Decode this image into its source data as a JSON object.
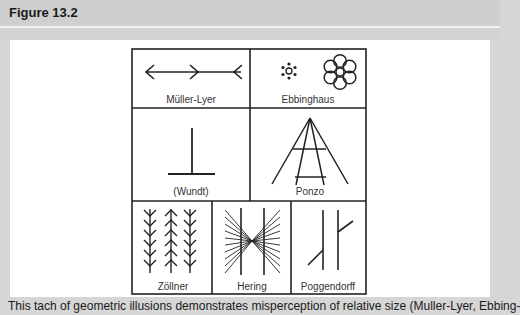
{
  "header": {
    "title": "Figure 13.2"
  },
  "figure": {
    "illusions": [
      {
        "name": "Müller-Lyer"
      },
      {
        "name": "Ebbinghaus"
      },
      {
        "name": "(Wundt)"
      },
      {
        "name": "Ponzo"
      },
      {
        "name": "Zöllner"
      },
      {
        "name": "Hering"
      },
      {
        "name": "Poggendorff"
      }
    ]
  },
  "caption": {
    "text": "This tach of geometric illusions demonstrates misperception of relative size (Muller-Lyer, Ebbing-"
  },
  "colors": {
    "header_bg": "#cfcfcf",
    "panel_bg": "#ffffff",
    "line": "#222222"
  }
}
